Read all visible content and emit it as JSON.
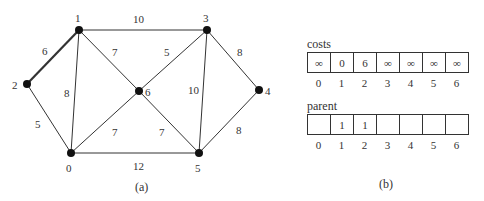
{
  "graph": {
    "caption": "(a)",
    "nodes": [
      {
        "id": "0",
        "x": 71,
        "y": 153,
        "lx": 66,
        "ly": 172
      },
      {
        "id": "1",
        "x": 79,
        "y": 30,
        "lx": 75,
        "ly": 22
      },
      {
        "id": "2",
        "x": 27,
        "y": 84,
        "lx": 12,
        "ly": 89
      },
      {
        "id": "3",
        "x": 207,
        "y": 30,
        "lx": 203,
        "ly": 22
      },
      {
        "id": "4",
        "x": 259,
        "y": 90,
        "lx": 265,
        "ly": 95
      },
      {
        "id": "5",
        "x": 199,
        "y": 153,
        "lx": 195,
        "ly": 172
      },
      {
        "id": "6",
        "x": 139,
        "y": 91,
        "lx": 145,
        "ly": 96
      }
    ],
    "edges": [
      {
        "from": "1",
        "to": "2",
        "weight": "6",
        "bold": true,
        "wx": 42,
        "wy": 55
      },
      {
        "from": "1",
        "to": "3",
        "weight": "10",
        "bold": false,
        "wx": 133,
        "wy": 23
      },
      {
        "from": "1",
        "to": "0",
        "weight": "8",
        "bold": false,
        "wx": 64,
        "wy": 97
      },
      {
        "from": "1",
        "to": "6",
        "weight": "7",
        "bold": false,
        "wx": 112,
        "wy": 56
      },
      {
        "from": "2",
        "to": "0",
        "weight": "5",
        "bold": false,
        "wx": 35,
        "wy": 128
      },
      {
        "from": "3",
        "to": "6",
        "weight": "5",
        "bold": false,
        "wx": 164,
        "wy": 56
      },
      {
        "from": "3",
        "to": "4",
        "weight": "8",
        "bold": false,
        "wx": 237,
        "wy": 56
      },
      {
        "from": "3",
        "to": "5",
        "weight": "10",
        "bold": false,
        "wx": 188,
        "wy": 94
      },
      {
        "from": "6",
        "to": "0",
        "weight": "7",
        "bold": false,
        "wx": 112,
        "wy": 136
      },
      {
        "from": "6",
        "to": "5",
        "weight": "7",
        "bold": false,
        "wx": 159,
        "wy": 136
      },
      {
        "from": "4",
        "to": "5",
        "weight": "8",
        "bold": false,
        "wx": 236,
        "wy": 134
      },
      {
        "from": "0",
        "to": "5",
        "weight": "12",
        "bold": false,
        "wx": 133,
        "wy": 170
      }
    ]
  },
  "arrays": {
    "caption": "(b)",
    "costs": {
      "label": "costs",
      "values": [
        "∞",
        "0",
        "6",
        "∞",
        "∞",
        "∞",
        "∞"
      ],
      "indices": [
        "0",
        "1",
        "2",
        "3",
        "4",
        "5",
        "6"
      ]
    },
    "parent": {
      "label": "parent",
      "values": [
        "",
        "1",
        "1",
        "",
        "",
        "",
        ""
      ],
      "indices": [
        "0",
        "1",
        "2",
        "3",
        "4",
        "5",
        "6"
      ]
    }
  }
}
